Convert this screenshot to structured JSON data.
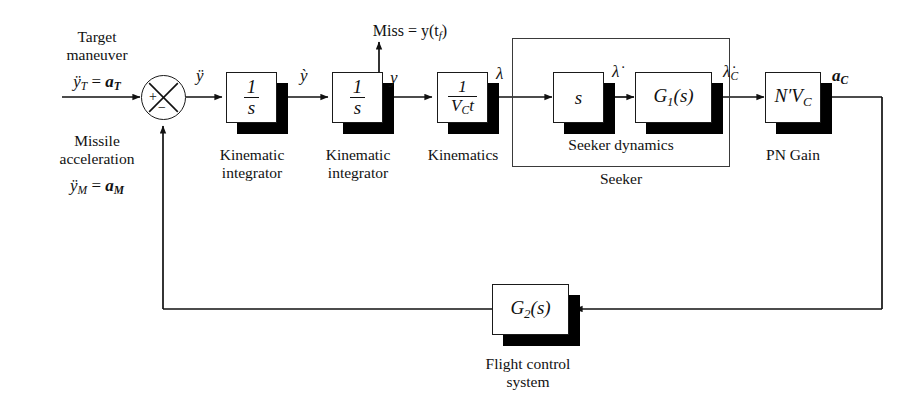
{
  "figure": {
    "type": "block-diagram"
  },
  "inputs": {
    "target": {
      "line1": "Target",
      "line2": "maneuver",
      "equation_lhs": "ÿ",
      "equation_lhs_sub": "T",
      "equation_rhs": "a",
      "equation_rhs_sub": "T",
      "equation": "ÿ_T = a_T"
    },
    "missile": {
      "line1": "Missile",
      "line2": "acceleration",
      "equation_lhs": "ÿ",
      "equation_lhs_sub": "M",
      "equation_rhs": "a",
      "equation_rhs_sub": "M",
      "equation": "ÿ_M = a_M"
    }
  },
  "summing_junction": {
    "name": "summing-junction",
    "plus": "+",
    "minus": "−"
  },
  "signals": {
    "accel_error": "ÿ",
    "velocity": "ỳ",
    "position": "y",
    "los_angle": "λ",
    "los_rate": "λ̇",
    "los_rate_cmd": "λ̇",
    "los_rate_cmd_sub": "C",
    "accel_cmd": "a",
    "accel_cmd_sub": "C"
  },
  "miss": {
    "label": "Miss = y(t",
    "sub": "f",
    "tail": ")",
    "full": "Miss = y(t_f)"
  },
  "blocks": [
    {
      "id": "kinematic-integrator-1",
      "expr_num": "1",
      "expr_den": "s",
      "caption_line1": "Kinematic",
      "caption_line2": "integrator"
    },
    {
      "id": "kinematic-integrator-2",
      "expr_num": "1",
      "expr_den": "s",
      "caption_line1": "Kinematic",
      "caption_line2": "integrator"
    },
    {
      "id": "kinematics",
      "expr_num": "1",
      "expr_den": "V",
      "expr_den_sub": "C",
      "expr_den_tail": "t",
      "caption_line1": "Kinematics",
      "caption_line2": ""
    },
    {
      "id": "seeker-differentiator",
      "expr": "s",
      "caption_line1": "",
      "caption_line2": ""
    },
    {
      "id": "seeker-dynamics-g1",
      "expr": "G",
      "expr_sub": "1",
      "expr_tail": "(s)",
      "caption_line1": "",
      "caption_line2": ""
    },
    {
      "id": "pn-gain",
      "expr": "N′V",
      "expr_sub": "C",
      "caption_line1": "PN Gain",
      "caption_line2": ""
    },
    {
      "id": "flight-control-g2",
      "expr": "G",
      "expr_sub": "2",
      "expr_tail": "(s)",
      "caption_line1": "Flight control",
      "caption_line2": "system"
    }
  ],
  "groups": [
    {
      "id": "seeker-dynamics-group",
      "label": "Seeker dynamics"
    },
    {
      "id": "seeker-group",
      "label": "Seeker"
    }
  ],
  "colors": {
    "ink": "#111111",
    "shadow": "#000000",
    "background": "#ffffff",
    "group_border": "#3a3a3a"
  }
}
